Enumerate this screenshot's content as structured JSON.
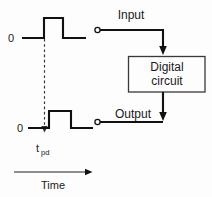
{
  "diagram": {
    "labels": {
      "zero_top": "0",
      "zero_bottom": "0",
      "tpd_base": "t",
      "tpd_subscript": "pd",
      "time_axis": "Time",
      "input": "Input",
      "output": "Output",
      "box_line1": "Digital",
      "box_line2": "circuit"
    },
    "colors": {
      "background": "#fdfdfd",
      "stroke": "#111111",
      "box_stroke": "#3a3a3a",
      "dashed_stroke": "#333333",
      "text": "#1a1a1a"
    },
    "waveforms": [
      {
        "name": "input-waveform",
        "baseline_y": 38,
        "high_y": 18,
        "rise_x": 44,
        "fall_x": 63,
        "start_x": 22,
        "end_x": 86,
        "level_low": "0",
        "level_high": "1"
      },
      {
        "name": "output-waveform",
        "baseline_y": 128,
        "high_y": 111,
        "rise_x": 49,
        "fall_x": 71,
        "start_x": 28,
        "end_x": 93,
        "level_low": "0",
        "level_high": "1"
      }
    ],
    "delay_marker": {
      "dashed_x": 44,
      "dashed_y_top": 38,
      "dashed_y_bottom": 131,
      "arrow": "down"
    },
    "time_axis": {
      "x_start": 14,
      "x_end": 92,
      "y": 172,
      "arrow": "right"
    },
    "block": {
      "x": 128,
      "y": 56,
      "width": 77,
      "height": 36
    },
    "connections": [
      {
        "name": "input-wire",
        "terminal_x": 97,
        "terminal_y": 30,
        "corner_x": 163,
        "target_y": 54,
        "arrow": "down"
      },
      {
        "name": "output-wire",
        "terminal_x": 97,
        "terminal_y": 122,
        "corner_x": 163,
        "source_y": 92,
        "arrow": "down"
      }
    ]
  }
}
